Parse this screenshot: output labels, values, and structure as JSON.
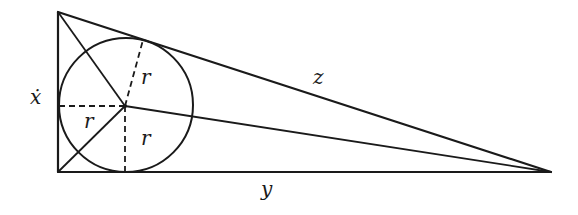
{
  "diagram": {
    "type": "right triangle with inscribed circle",
    "labels": {
      "left_leg": "ẋ",
      "bottom_leg": "y",
      "hypotenuse": "z",
      "radius_upper": "r",
      "radius_left": "r",
      "radius_lower": "r"
    },
    "vertices": {
      "top_left": [
        58,
        12
      ],
      "bottom_left": [
        58,
        172
      ],
      "right": [
        551,
        172
      ]
    },
    "incircle": {
      "center": [
        125,
        106
      ],
      "radius": 67
    },
    "colors": {
      "stroke": "#1a1a1a",
      "background": "#ffffff"
    }
  }
}
